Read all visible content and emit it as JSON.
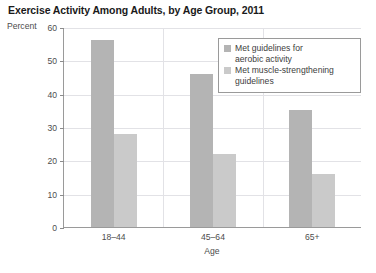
{
  "chart_data": {
    "type": "bar",
    "title": "Exercise Activity Among Adults, by Age Group, 2011",
    "xlabel": "Age",
    "ylabel": "Percent",
    "categories": [
      "18–44",
      "45–64",
      "65+"
    ],
    "series": [
      {
        "name": "Met guidelines for aerobic activity",
        "color": "#b4b4b4",
        "values": [
          56,
          46,
          35
        ]
      },
      {
        "name": "Met muscle-strengthening guidelines",
        "color": "#cacaca",
        "values": [
          28,
          22,
          16
        ]
      }
    ],
    "ylim": [
      0,
      60
    ],
    "yticks": [
      0,
      10,
      20,
      30,
      40,
      50,
      60
    ],
    "ytick_labels": [
      "0",
      "10",
      "20",
      "30",
      "40",
      "50",
      "60"
    ],
    "grid": true,
    "legend_position": "top-right"
  },
  "legend": {
    "entries": [
      {
        "line1": "Met guidelines for",
        "line2": "aerobic activity"
      },
      {
        "line1": "Met muscle-strengthening",
        "line2": "guidelines"
      }
    ]
  }
}
